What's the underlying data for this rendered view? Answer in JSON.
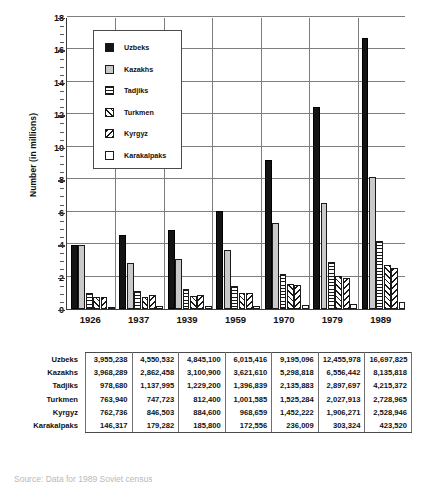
{
  "chart_data": {
    "type": "bar",
    "title": "",
    "xlabel": "",
    "ylabel": "Number (in millions)",
    "ylim": [
      0,
      18
    ],
    "ytick_step": 2,
    "yticks": [
      0,
      2,
      4,
      6,
      8,
      10,
      12,
      14,
      16,
      18
    ],
    "grid": "horizontal-and-vertical",
    "legend_position": "upper-left-inside",
    "units": "millions",
    "categories": [
      "1926",
      "1937",
      "1939",
      "1959",
      "1970",
      "1979",
      "1989"
    ],
    "series": [
      {
        "name": "Uzbeks",
        "swatch": "solid-black",
        "color": "#141414",
        "values": [
          3.955238,
          4.550532,
          4.8451,
          6.015416,
          9.195096,
          12.455978,
          16.697825
        ],
        "raw": [
          "3,955,238",
          "4,550,532",
          "4,845,100",
          "6,015,416",
          "9,195,096",
          "12,455,978",
          "16,697,825"
        ]
      },
      {
        "name": "Kazakhs",
        "swatch": "solid-gray",
        "color": "#c9c9c9",
        "values": [
          3.968289,
          2.862458,
          3.1009,
          3.62161,
          5.298818,
          6.556442,
          8.135818
        ],
        "raw": [
          "3,968,289",
          "2,862,458",
          "3,100,900",
          "3,621,610",
          "5,298,818",
          "6,556,442",
          "8,135,818"
        ]
      },
      {
        "name": "Tadjiks",
        "swatch": "horizontal-lines",
        "color": "#ffffff",
        "values": [
          0.97868,
          1.137995,
          1.2292,
          1.396839,
          2.135883,
          2.897697,
          4.215372
        ],
        "raw": [
          "978,680",
          "1,137,995",
          "1,229,200",
          "1,396,839",
          "2,135,883",
          "2,897,697",
          "4,215,372"
        ]
      },
      {
        "name": "Turkmen",
        "swatch": "cross-hatch",
        "color": "#ffffff",
        "values": [
          0.76394,
          0.747723,
          0.8124,
          1.001585,
          1.525284,
          2.027913,
          2.728965
        ],
        "raw": [
          "763,940",
          "747,723",
          "812,400",
          "1,001,585",
          "1,525,284",
          "2,027,913",
          "2,728,965"
        ]
      },
      {
        "name": "Kyrgyz",
        "swatch": "diagonal-lines",
        "color": "#ffffff",
        "values": [
          0.762736,
          0.846503,
          0.8846,
          0.968659,
          1.452222,
          1.906271,
          2.528946
        ],
        "raw": [
          "762,736",
          "846,503",
          "884,600",
          "968,659",
          "1,452,222",
          "1,906,271",
          "2,528,946"
        ]
      },
      {
        "name": "Karakalpaks",
        "swatch": "white-empty",
        "color": "#ffffff",
        "values": [
          0.146317,
          0.179282,
          0.1858,
          0.172556,
          0.236009,
          0.303324,
          0.42352
        ],
        "raw": [
          "146,317",
          "179,282",
          "185,800",
          "172,556",
          "236,009",
          "303,324",
          "423,520"
        ]
      }
    ]
  },
  "legend": {
    "items": [
      {
        "label": "Uzbeks"
      },
      {
        "label": "Kazakhs"
      },
      {
        "label": "Tadjiks"
      },
      {
        "label": "Turkmen"
      },
      {
        "label": "Kyrgyz"
      },
      {
        "label": "Karakalpaks"
      }
    ]
  },
  "table": {
    "columns": [
      "1926",
      "1937",
      "1939",
      "1959",
      "1970",
      "1979",
      "1989"
    ],
    "rows": [
      {
        "label": "Uzbeks",
        "values": [
          "3,955,238",
          "4,550,532",
          "4,845,100",
          "6,015,416",
          "9,195,096",
          "12,455,978",
          "16,697,825"
        ]
      },
      {
        "label": "Kazakhs",
        "values": [
          "3,968,289",
          "2,862,458",
          "3,100,900",
          "3,621,610",
          "5,298,818",
          "6,556,442",
          "8,135,818"
        ]
      },
      {
        "label": "Tadjiks",
        "values": [
          "978,680",
          "1,137,995",
          "1,229,200",
          "1,396,839",
          "2,135,883",
          "2,897,697",
          "4,215,372"
        ]
      },
      {
        "label": "Turkmen",
        "values": [
          "763,940",
          "747,723",
          "812,400",
          "1,001,585",
          "1,525,284",
          "2,027,913",
          "2,728,965"
        ]
      },
      {
        "label": "Kyrgyz",
        "values": [
          "762,736",
          "846,503",
          "884,600",
          "968,659",
          "1,452,222",
          "1,906,271",
          "2,528,946"
        ]
      },
      {
        "label": "Karakalpaks",
        "values": [
          "146,317",
          "179,282",
          "185,800",
          "172,556",
          "236,009",
          "303,324",
          "423,520"
        ]
      }
    ]
  },
  "caption": "Source: Data for 1989 Soviet census"
}
